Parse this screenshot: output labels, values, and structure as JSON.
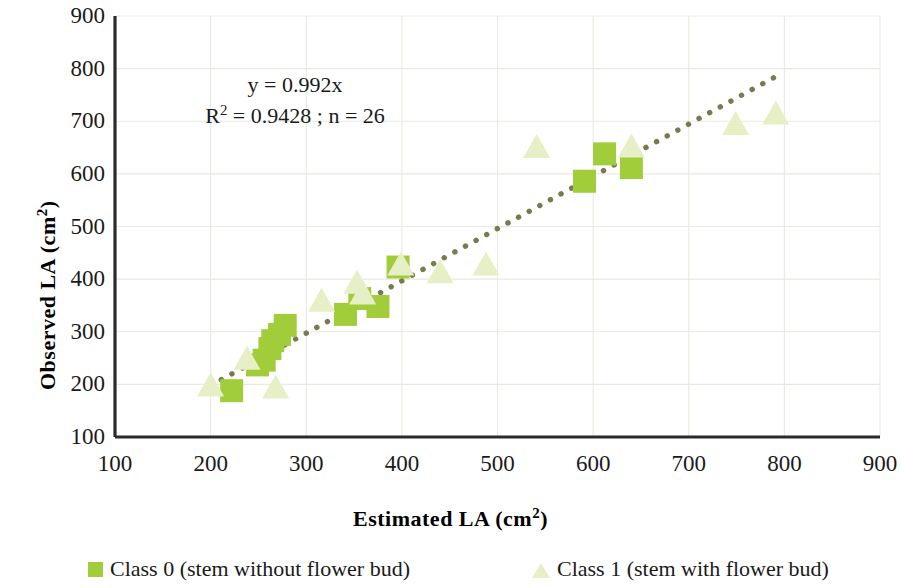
{
  "chart_data": {
    "type": "scatter",
    "title": "",
    "xlabel": "Estimated LA (cm2)",
    "ylabel": "Observed LA (cm2)",
    "xlabel_base": "Estimated LA (cm",
    "xlabel_sup": "2",
    "xlabel_tail": ")",
    "ylabel_base": "Observed LA  (cm",
    "ylabel_sup": "2",
    "ylabel_tail": ")",
    "xlim": [
      100,
      900
    ],
    "ylim": [
      100,
      900
    ],
    "xticks": [
      100,
      200,
      300,
      400,
      500,
      600,
      700,
      800,
      900
    ],
    "yticks": [
      100,
      200,
      300,
      400,
      500,
      600,
      700,
      800,
      900
    ],
    "grid": true,
    "grid_color": "#e9e9e2",
    "legend_position": "bottom",
    "annotation_line1": "y = 0.992x",
    "annotation_line2_base": "R",
    "annotation_line2_sup": "2",
    "annotation_line2_tail": " = 0.9428 ; n = 26",
    "trendline": {
      "name": "1:1 fit line",
      "style": "dotted",
      "color": "#7a7a52",
      "slope": 0.992,
      "intercept": 0,
      "x_start": 200,
      "x_end": 790,
      "y_start": 198,
      "y_end": 784
    },
    "series": [
      {
        "name": "Class 0 (stem without flower bud)",
        "marker": "square",
        "color": "#a2cd3a",
        "points": [
          {
            "x": 222,
            "y": 188
          },
          {
            "x": 249,
            "y": 237
          },
          {
            "x": 256,
            "y": 246
          },
          {
            "x": 262,
            "y": 268
          },
          {
            "x": 265,
            "y": 283
          },
          {
            "x": 272,
            "y": 295
          },
          {
            "x": 278,
            "y": 312
          },
          {
            "x": 341,
            "y": 333
          },
          {
            "x": 356,
            "y": 363
          },
          {
            "x": 375,
            "y": 348
          },
          {
            "x": 396,
            "y": 423
          },
          {
            "x": 591,
            "y": 586
          },
          {
            "x": 612,
            "y": 638
          },
          {
            "x": 640,
            "y": 612
          }
        ]
      },
      {
        "name": "Class 1 (stem with flower bud)",
        "marker": "triangle",
        "color": "#e6efc6",
        "points": [
          {
            "x": 200,
            "y": 197
          },
          {
            "x": 238,
            "y": 248
          },
          {
            "x": 268,
            "y": 193
          },
          {
            "x": 316,
            "y": 358
          },
          {
            "x": 353,
            "y": 392
          },
          {
            "x": 359,
            "y": 372
          },
          {
            "x": 399,
            "y": 427
          },
          {
            "x": 440,
            "y": 412
          },
          {
            "x": 488,
            "y": 427
          },
          {
            "x": 541,
            "y": 650
          },
          {
            "x": 640,
            "y": 651
          },
          {
            "x": 749,
            "y": 694
          },
          {
            "x": 791,
            "y": 714
          }
        ]
      }
    ]
  },
  "legend": {
    "entries": [
      {
        "label": "Class 0 (stem without flower bud)",
        "marker": "square",
        "color": "#a2cd3a"
      },
      {
        "label": "Class 1 (stem with flower bud)",
        "marker": "triangle",
        "color": "#e6efc6"
      }
    ]
  }
}
